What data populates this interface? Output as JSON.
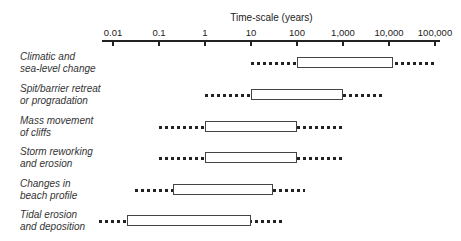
{
  "chart_data": {
    "type": "range-bar",
    "title": "",
    "xlabel": "Time-scale (years)",
    "ylabel": "",
    "x_scale": "log",
    "xlim": [
      0.005,
      100000
    ],
    "ticks": [
      "0.01",
      "0.1",
      "1",
      "10",
      "100",
      "1,000",
      "10,000",
      "100,000"
    ],
    "tick_values": [
      0.01,
      0.1,
      1,
      10,
      100,
      1000,
      10000,
      100000
    ],
    "grid": false,
    "legend": null,
    "series": [
      {
        "name": "Climatic and sea-level change",
        "label_lines": "Climatic and\nsea-level change",
        "dots_min": 10,
        "box_min": 100,
        "box_max": 12000,
        "dots_max": 100000
      },
      {
        "name": "Spit/barrier retreat or progradation",
        "label_lines": "Spit/barrier retreat\nor progradation",
        "dots_min": 1,
        "box_min": 10,
        "box_max": 1000,
        "dots_max": 7000
      },
      {
        "name": "Mass movement of cliffs",
        "label_lines": "Mass movement\nof cliffs",
        "dots_min": 0.1,
        "box_min": 1,
        "box_max": 100,
        "dots_max": 1000
      },
      {
        "name": "Storm reworking and erosion",
        "label_lines": "Storm reworking\nand erosion",
        "dots_min": 0.1,
        "box_min": 1,
        "box_max": 100,
        "dots_max": 1000
      },
      {
        "name": "Changes in beach profile",
        "label_lines": "Changes in\nbeach profile",
        "dots_min": 0.03,
        "box_min": 0.2,
        "box_max": 30,
        "dots_max": 150
      },
      {
        "name": "Tidal erosion and deposition",
        "label_lines": "Tidal erosion\nand deposition",
        "dots_min": 0.005,
        "box_min": 0.02,
        "box_max": 10,
        "dots_max": 50
      }
    ]
  }
}
